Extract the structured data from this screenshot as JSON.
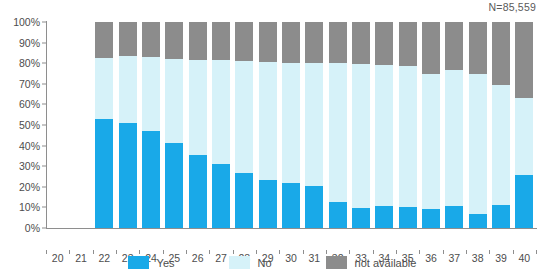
{
  "chart_data": {
    "type": "bar",
    "subtype": "stacked-percentage-bar",
    "title": "",
    "subtitle": "",
    "xlabel": "",
    "ylabel": "",
    "ylim": [
      0,
      100
    ],
    "ytick_labels": [
      "0%",
      "10%",
      "20%",
      "30%",
      "40%",
      "50%",
      "60%",
      "70%",
      "80%",
      "90%",
      "100%"
    ],
    "ytick_values": [
      0,
      10,
      20,
      30,
      40,
      50,
      60,
      70,
      80,
      90,
      100
    ],
    "grid": false,
    "legend_position": "bottom",
    "annotation": "N=85,559",
    "categories": [
      "20",
      "21",
      "22",
      "23",
      "24",
      "25",
      "26",
      "27",
      "28",
      "29",
      "30",
      "31",
      "32",
      "33",
      "34",
      "35",
      "36",
      "37",
      "38",
      "39",
      "40"
    ],
    "series": [
      {
        "name": "Yes",
        "color": "#19A9E8",
        "values": [
          0,
          0,
          53,
          51,
          47,
          41.5,
          35.5,
          31,
          26.5,
          23.5,
          22,
          20.5,
          12.5,
          9.5,
          10.5,
          10,
          9,
          10.5,
          7,
          11,
          25.5
        ]
      },
      {
        "name": "No",
        "color": "#D6F2F9",
        "values": [
          0,
          0,
          29.5,
          32.5,
          36,
          40.5,
          46,
          50.5,
          54.5,
          57,
          58,
          59.5,
          67.5,
          70,
          68.5,
          68.5,
          66,
          66,
          68,
          58.5,
          37.5
        ]
      },
      {
        "name": "not available",
        "color": "#8C8C8C",
        "values": [
          0,
          0,
          17.5,
          16.5,
          17,
          18,
          18.5,
          18.5,
          19,
          19.5,
          20,
          20,
          20,
          20.5,
          21,
          21.5,
          25,
          23.5,
          25,
          30.5,
          37
        ]
      }
    ]
  },
  "legend": {
    "items": [
      {
        "label": "Yes",
        "color": "#19A9E8"
      },
      {
        "label": "No",
        "color": "#D6F2F9"
      },
      {
        "label": "not available",
        "color": "#8C8C8C"
      }
    ]
  },
  "annotation": {
    "n_label": "N=85,559"
  }
}
